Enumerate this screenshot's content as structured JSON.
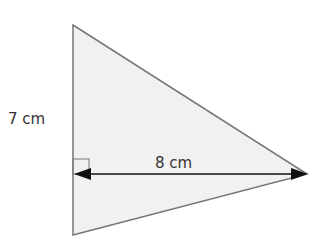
{
  "diagram": {
    "shape": "triangle",
    "fill_color": "#f1f1f1",
    "stroke_color": "#777777",
    "arrow_color": "#111111",
    "labels": {
      "height": "7 cm",
      "base": "8 cm"
    },
    "right_angle_marker": true
  }
}
